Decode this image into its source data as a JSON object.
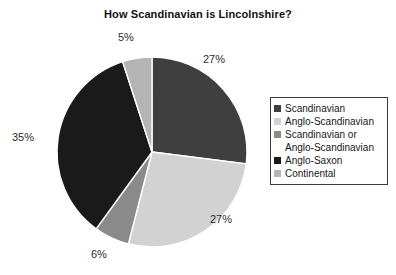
{
  "chart_data": {
    "type": "pie",
    "title": "How Scandinavian is Lincolnshire?",
    "xlabel": "",
    "ylabel": "",
    "legend_position": "right",
    "grid": false,
    "categories": [
      "Scandinavian",
      "Anglo-Scandinavian",
      "Scandinavian or Anglo-Scandinavian",
      "Anglo-Saxon",
      "Continental"
    ],
    "values": [
      27,
      27,
      6,
      35,
      5
    ],
    "value_labels": [
      "27%",
      "27%",
      "6%",
      "35%",
      "5%"
    ],
    "colors": [
      "#3f3f3f",
      "#d2d2d2",
      "#8a8a8a",
      "#1a1a1a",
      "#b4b4b4"
    ],
    "units": "percent",
    "start_angle_deg": 0,
    "direction": "clockwise"
  },
  "chart": {
    "title": "How Scandinavian is Lincolnshire?",
    "labels": [
      {
        "text": "5%",
        "left": 118,
        "top": 31
      },
      {
        "text": "27%",
        "left": 203,
        "top": 53
      },
      {
        "text": "27%",
        "left": 210,
        "top": 213
      },
      {
        "text": "6%",
        "left": 91,
        "top": 248
      },
      {
        "text": "35%",
        "left": 12,
        "top": 131
      }
    ],
    "geometry": {
      "cx": 152,
      "cy": 152,
      "r": 95
    }
  },
  "legend": {
    "entries": [
      {
        "label": "Scandinavian",
        "color": "#3f3f3f",
        "swatch": true
      },
      {
        "label": "Anglo-Scandinavian",
        "color": "#d2d2d2",
        "swatch": true
      },
      {
        "label": "Scandinavian or",
        "color": "#8a8a8a",
        "swatch": true
      },
      {
        "label": "Anglo-Scandinavian",
        "color": "",
        "swatch": false
      },
      {
        "label": "Anglo-Saxon",
        "color": "#1a1a1a",
        "swatch": true
      },
      {
        "label": "Continental",
        "color": "#b4b4b4",
        "swatch": true
      }
    ]
  }
}
